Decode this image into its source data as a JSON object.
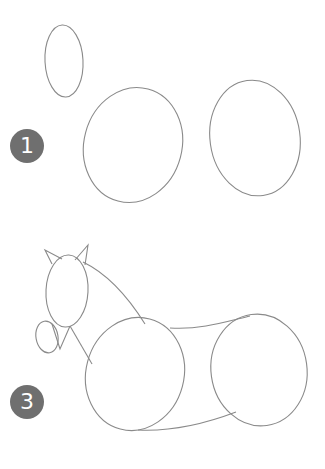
{
  "steps": [
    {
      "number": "1",
      "description": "Basic oval shapes: head, chest, hindquarters"
    },
    {
      "number": "3",
      "description": "Horse outline: ears, muzzle, neck, back and belly connecting shapes"
    }
  ],
  "colors": {
    "badge": "#6f6f6f",
    "badge_text": "#ffffff",
    "line": "#8a8a8a",
    "background": "#ffffff"
  }
}
